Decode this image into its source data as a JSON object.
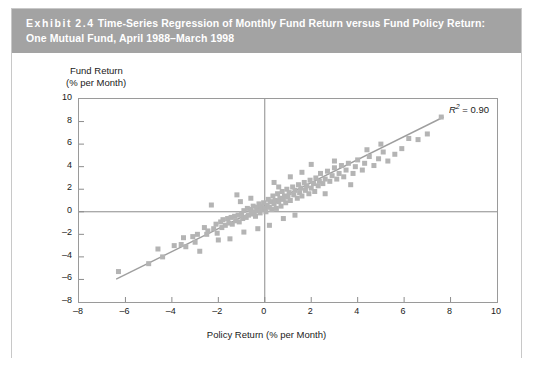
{
  "header": {
    "exhibit_word": "Exhibit",
    "exhibit_number": "2.4",
    "title_line1": "Time-Series Regression of Monthly Fund Return versus Fund Policy Return:",
    "title_line2": "One Mutual Fund, April 1988–March 1998",
    "background_color": "#a3a3a3",
    "text_color": "#ffffff"
  },
  "annotation": {
    "r2_symbol": "R",
    "r2_exponent": "2",
    "r2_equals": " = 0.90",
    "r2_full": "R2 = 0.90"
  },
  "chart_data": {
    "type": "scatter",
    "title": "",
    "xlabel": "Policy Return (% per Month)",
    "ylabel_line1": "Fund Return",
    "ylabel_line2": "(% per Month)",
    "xlim": [
      -8,
      10
    ],
    "ylim": [
      -8,
      10
    ],
    "xticks": [
      -8,
      -6,
      -4,
      -2,
      0,
      2,
      4,
      6,
      8,
      10
    ],
    "yticks": [
      -8,
      -6,
      -4,
      -2,
      0,
      2,
      4,
      6,
      8,
      10
    ],
    "xticklabels": [
      "–8",
      "–6",
      "–4",
      "–2",
      "0",
      "2",
      "4",
      "6",
      "8",
      "10"
    ],
    "yticklabels": [
      "–8",
      "–6",
      "–4",
      "–2",
      "0",
      "2",
      "4",
      "6",
      "8",
      "10"
    ],
    "grid": false,
    "legend": null,
    "marker": {
      "shape": "square",
      "color": "#b4b4b4",
      "size": 5
    },
    "zero_lines": {
      "x": 0,
      "y": 0,
      "color": "#808080"
    },
    "trendline": {
      "type": "linear-fit",
      "color": "#9e9e9e",
      "slope": 1.02,
      "intercept": 0.55,
      "x_start": -6.4,
      "x_end": 7.7,
      "r_squared": 0.9
    },
    "series": [
      {
        "name": "Monthly fund vs policy return",
        "points": [
          [
            -6.3,
            -5.3
          ],
          [
            -5.0,
            -4.6
          ],
          [
            -4.4,
            -4.0
          ],
          [
            -3.6,
            -2.9
          ],
          [
            -3.5,
            -2.3
          ],
          [
            -3.4,
            -3.1
          ],
          [
            -3.1,
            -2.2
          ],
          [
            -3.0,
            -2.7
          ],
          [
            -2.9,
            -2.0
          ],
          [
            -2.6,
            -1.4
          ],
          [
            -2.5,
            -2.0
          ],
          [
            -2.45,
            -1.7
          ],
          [
            -2.2,
            -1.5
          ],
          [
            -2.1,
            -1.1
          ],
          [
            -2.05,
            -1.9
          ],
          [
            -1.9,
            -0.9
          ],
          [
            -1.85,
            -1.4
          ],
          [
            -1.8,
            -0.7
          ],
          [
            -1.7,
            -1.2
          ],
          [
            -1.6,
            -0.6
          ],
          [
            -1.55,
            -1.0
          ],
          [
            -1.45,
            -0.5
          ],
          [
            -1.4,
            -1.1
          ],
          [
            -1.3,
            -0.4
          ],
          [
            -1.25,
            -0.8
          ],
          [
            -1.15,
            -0.3
          ],
          [
            -1.1,
            -0.9
          ],
          [
            -1.0,
            -0.2
          ],
          [
            -0.95,
            -0.6
          ],
          [
            -0.9,
            0.1
          ],
          [
            -0.8,
            -0.5
          ],
          [
            -0.75,
            0.3
          ],
          [
            -0.7,
            -0.3
          ],
          [
            -0.6,
            0.2
          ],
          [
            -0.55,
            -0.2
          ],
          [
            -0.5,
            0.5
          ],
          [
            -0.45,
            0.0
          ],
          [
            -0.4,
            -0.4
          ],
          [
            -0.35,
            0.4
          ],
          [
            -0.3,
            0.1
          ],
          [
            -0.25,
            0.7
          ],
          [
            -0.2,
            -0.1
          ],
          [
            -0.15,
            0.5
          ],
          [
            -0.1,
            0.2
          ],
          [
            -0.05,
            0.8
          ],
          [
            0.0,
            0.3
          ],
          [
            0.05,
            0.0
          ],
          [
            0.1,
            0.6
          ],
          [
            0.15,
            1.1
          ],
          [
            0.2,
            0.4
          ],
          [
            0.25,
            0.9
          ],
          [
            0.3,
            0.2
          ],
          [
            0.35,
            1.4
          ],
          [
            0.4,
            0.7
          ],
          [
            0.45,
            1.0
          ],
          [
            0.5,
            0.3
          ],
          [
            0.55,
            1.6
          ],
          [
            0.6,
            0.9
          ],
          [
            0.65,
            1.2
          ],
          [
            0.7,
            0.5
          ],
          [
            0.75,
            1.8
          ],
          [
            0.8,
            1.1
          ],
          [
            0.85,
            1.4
          ],
          [
            0.9,
            0.8
          ],
          [
            0.95,
            2.0
          ],
          [
            1.0,
            1.3
          ],
          [
            1.05,
            1.7
          ],
          [
            1.1,
            1.0
          ],
          [
            1.2,
            2.2
          ],
          [
            1.25,
            1.5
          ],
          [
            1.3,
            1.9
          ],
          [
            1.4,
            1.2
          ],
          [
            1.45,
            2.4
          ],
          [
            1.5,
            1.7
          ],
          [
            1.55,
            2.1
          ],
          [
            1.6,
            1.4
          ],
          [
            1.7,
            2.6
          ],
          [
            1.75,
            1.9
          ],
          [
            1.8,
            2.3
          ],
          [
            1.9,
            1.6
          ],
          [
            1.95,
            2.8
          ],
          [
            2.0,
            2.1
          ],
          [
            2.1,
            2.5
          ],
          [
            2.15,
            1.8
          ],
          [
            2.2,
            3.0
          ],
          [
            2.3,
            2.3
          ],
          [
            2.35,
            2.7
          ],
          [
            2.4,
            3.4
          ],
          [
            2.5,
            2.5
          ],
          [
            2.6,
            2.9
          ],
          [
            2.7,
            3.6
          ],
          [
            2.8,
            2.7
          ],
          [
            2.9,
            3.2
          ],
          [
            3.0,
            3.9
          ],
          [
            3.1,
            2.9
          ],
          [
            3.2,
            3.4
          ],
          [
            3.3,
            4.1
          ],
          [
            3.4,
            3.1
          ],
          [
            3.5,
            3.7
          ],
          [
            3.6,
            4.3
          ],
          [
            3.8,
            3.4
          ],
          [
            3.9,
            4.0
          ],
          [
            4.0,
            4.6
          ],
          [
            4.2,
            3.7
          ],
          [
            4.3,
            4.3
          ],
          [
            4.5,
            4.9
          ],
          [
            4.7,
            4.1
          ],
          [
            4.9,
            4.7
          ],
          [
            5.1,
            5.3
          ],
          [
            5.3,
            4.5
          ],
          [
            5.6,
            5.1
          ],
          [
            5.9,
            5.6
          ],
          [
            6.2,
            6.5
          ],
          [
            6.6,
            6.4
          ],
          [
            7.0,
            6.9
          ],
          [
            7.6,
            8.4
          ],
          [
            -2.3,
            0.6
          ],
          [
            -1.2,
            1.5
          ],
          [
            -0.6,
            1.2
          ],
          [
            0.4,
            2.6
          ],
          [
            1.1,
            3.1
          ],
          [
            2.0,
            4.2
          ],
          [
            -0.9,
            -1.8
          ],
          [
            0.2,
            -1.2
          ],
          [
            1.3,
            -0.3
          ],
          [
            2.6,
            1.6
          ],
          [
            3.7,
            2.4
          ],
          [
            -4.6,
            -3.3
          ],
          [
            -2.8,
            -3.5
          ],
          [
            -1.5,
            -2.4
          ],
          [
            -0.3,
            -1.5
          ],
          [
            0.8,
            -0.6
          ],
          [
            4.4,
            5.5
          ],
          [
            5.0,
            6.0
          ],
          [
            -3.9,
            -3.0
          ],
          [
            -2.0,
            -2.5
          ],
          [
            0.6,
            2.2
          ],
          [
            1.6,
            3.5
          ],
          [
            3.0,
            4.5
          ],
          [
            -1.05,
            0.9
          ]
        ]
      }
    ]
  }
}
